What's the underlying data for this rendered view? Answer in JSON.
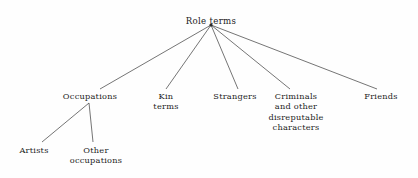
{
  "diagram": {
    "type": "tree",
    "background_color": "#fefefe",
    "line_color": "#3a3a3a",
    "text_color": "#1c1c1c",
    "root": {
      "id": "role-terms",
      "label": "Role terms",
      "x": 211,
      "y": 16
    },
    "nodes": [
      {
        "id": "occupations",
        "label": "Occupations",
        "x": 90,
        "y": 91,
        "parent": "role-terms",
        "edge_end_x": 100,
        "edge_end_y": 89
      },
      {
        "id": "kin-terms",
        "label": "Kin\nterms",
        "x": 166,
        "y": 91,
        "parent": "role-terms",
        "edge_end_x": 166,
        "edge_end_y": 89
      },
      {
        "id": "strangers",
        "label": "Strangers",
        "x": 235,
        "y": 91,
        "parent": "role-terms",
        "edge_end_x": 238,
        "edge_end_y": 89
      },
      {
        "id": "criminals",
        "label": "Criminals\nand other\ndisreputable\ncharacters",
        "x": 296,
        "y": 91,
        "parent": "role-terms",
        "edge_end_x": 290,
        "edge_end_y": 89
      },
      {
        "id": "friends",
        "label": "Friends",
        "x": 381,
        "y": 91,
        "parent": "role-terms",
        "edge_end_x": 377,
        "edge_end_y": 89
      },
      {
        "id": "artists",
        "label": "Artists",
        "x": 34,
        "y": 145,
        "parent": "occupations",
        "edge_end_x": 42,
        "edge_end_y": 142
      },
      {
        "id": "other-occupations",
        "label": "Other\noccupations",
        "x": 96,
        "y": 145,
        "parent": "occupations",
        "edge_end_x": 93,
        "edge_end_y": 142
      }
    ],
    "edges": [
      {
        "id": "edge-root-occupations",
        "x1": 211,
        "y1": 25,
        "x2": 100,
        "y2": 89
      },
      {
        "id": "edge-root-kin-terms",
        "x1": 211,
        "y1": 25,
        "x2": 166,
        "y2": 89
      },
      {
        "id": "edge-root-strangers",
        "x1": 211,
        "y1": 25,
        "x2": 238,
        "y2": 89
      },
      {
        "id": "edge-root-criminals",
        "x1": 211,
        "y1": 25,
        "x2": 290,
        "y2": 89
      },
      {
        "id": "edge-root-friends",
        "x1": 211,
        "y1": 25,
        "x2": 377,
        "y2": 89
      },
      {
        "id": "edge-occupations-artists",
        "x1": 89,
        "y1": 103,
        "x2": 42,
        "y2": 142
      },
      {
        "id": "edge-occupations-other",
        "x1": 89,
        "y1": 103,
        "x2": 93,
        "y2": 142
      }
    ]
  }
}
